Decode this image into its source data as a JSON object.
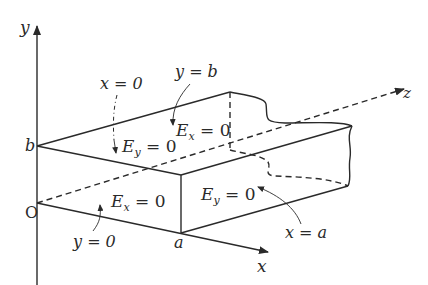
{
  "figure": {
    "axes": {
      "x_label": "x",
      "y_label": "y",
      "z_label": "z",
      "origin_label": "O"
    },
    "dimensions": {
      "a_label": "a",
      "b_label": "b"
    },
    "wall_labels": {
      "x0": "x = 0",
      "yb": "y = b",
      "y0": "y = 0",
      "xa": "x = a"
    },
    "field_conditions": {
      "top_Ey": {
        "E": "E",
        "sub": "y",
        "eq": " = 0"
      },
      "top_Ex": {
        "E": "E",
        "sub": "x",
        "eq": " = 0"
      },
      "front_Ex": {
        "E": "E",
        "sub": "x",
        "eq": " = 0"
      },
      "right_Ey": {
        "E": "E",
        "sub": "y",
        "eq": " = 0"
      }
    },
    "colors": {
      "ink": "#2a2a2a",
      "background": "#ffffff"
    }
  }
}
